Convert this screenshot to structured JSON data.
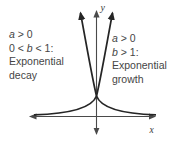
{
  "figure": {
    "colors": {
      "background": "#ffffff",
      "curve": "#252525",
      "axis": "#4a4a4a",
      "text": "#454545"
    },
    "axis_labels": {
      "x": "x",
      "y": "y"
    },
    "left_annotation": {
      "l1_var": "a",
      "l1_rest": " > 0",
      "l2_pre": "0 < ",
      "l2_var": "b",
      "l2_post": " < 1:",
      "l3": "Exponential",
      "l4": "decay"
    },
    "right_annotation": {
      "l1_var": "a",
      "l1_rest": " > 0",
      "l2_var": "b",
      "l2_rest": " > 1:",
      "l3": "Exponential",
      "l4": "growth"
    }
  }
}
